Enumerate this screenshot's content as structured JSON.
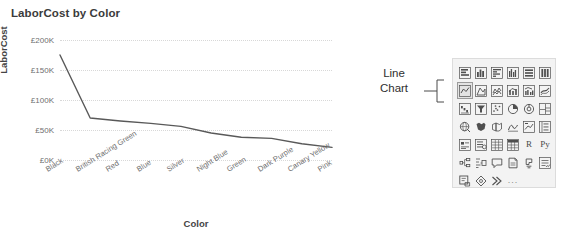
{
  "chart_data": {
    "type": "line",
    "title": "LaborCost by Color",
    "xlabel": "Color",
    "ylabel": "LaborCost",
    "categories": [
      "Black",
      "British Racing Green",
      "Red",
      "Blue",
      "Silver",
      "Night Blue",
      "Green",
      "Dark Purple",
      "Canary Yellow",
      "Pink"
    ],
    "values": [
      175000,
      70000,
      65000,
      61000,
      56000,
      45000,
      38000,
      36000,
      27000,
      21000
    ],
    "ytick_labels": [
      "£200K",
      "£150K",
      "£100K",
      "£50K",
      "£0K"
    ],
    "ytick_values": [
      200000,
      150000,
      100000,
      50000,
      0
    ],
    "ylim": [
      0,
      200000
    ],
    "grid": true,
    "legend": "none",
    "line_color": "#595959"
  },
  "callout": {
    "line1": "Line",
    "line2": "Chart"
  },
  "viz_pane": {
    "selected_index": 6,
    "icons": [
      {
        "name": "stacked-bar-chart-icon"
      },
      {
        "name": "stacked-column-chart-icon"
      },
      {
        "name": "clustered-bar-chart-icon"
      },
      {
        "name": "clustered-column-chart-icon"
      },
      {
        "name": "hundred-percent-stacked-bar-chart-icon"
      },
      {
        "name": "hundred-percent-stacked-column-chart-icon"
      },
      {
        "name": "line-chart-icon"
      },
      {
        "name": "area-chart-icon"
      },
      {
        "name": "stacked-area-chart-icon"
      },
      {
        "name": "line-and-stacked-column-chart-icon"
      },
      {
        "name": "line-and-clustered-column-chart-icon"
      },
      {
        "name": "ribbon-chart-icon"
      },
      {
        "name": "waterfall-chart-icon"
      },
      {
        "name": "funnel-chart-icon"
      },
      {
        "name": "scatter-chart-icon"
      },
      {
        "name": "pie-chart-icon"
      },
      {
        "name": "donut-chart-icon"
      },
      {
        "name": "treemap-icon"
      },
      {
        "name": "map-icon"
      },
      {
        "name": "filled-map-icon"
      },
      {
        "name": "shape-map-icon"
      },
      {
        "name": "arcgis-map-icon"
      },
      {
        "name": "kpi-icon"
      },
      {
        "name": "multi-row-card-icon"
      },
      {
        "name": "card-icon"
      },
      {
        "name": "slicer-icon"
      },
      {
        "name": "table-icon"
      },
      {
        "name": "matrix-icon"
      },
      {
        "name": "r-script-visual-icon",
        "glyph": "R"
      },
      {
        "name": "python-visual-icon",
        "glyph": "Py"
      },
      {
        "name": "decomposition-tree-icon"
      },
      {
        "name": "key-influencers-icon"
      },
      {
        "name": "qna-visual-icon"
      },
      {
        "name": "paginated-report-icon"
      },
      {
        "name": "power-apps-icon"
      },
      {
        "name": "smart-narrative-icon"
      },
      {
        "name": "power-automate-icon"
      },
      {
        "name": "azure-map-icon"
      },
      {
        "name": "arrow-visual-icon"
      },
      {
        "name": "more-options-ellipsis",
        "glyph": "..."
      }
    ]
  }
}
